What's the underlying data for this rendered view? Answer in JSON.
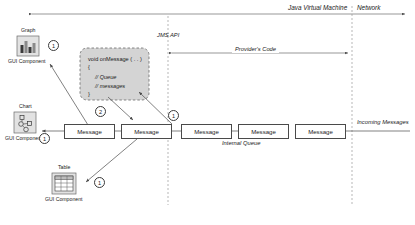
{
  "diagram": {
    "boundaries": {
      "jvm_label": "Java Virtual Machine",
      "network_label": "Network",
      "jms_api_label": "JMS API",
      "providers_code_label": "Provider's Code"
    },
    "gui_components": [
      {
        "id": "graph",
        "title": "Graph",
        "sublabel": "GUI Component",
        "icon": "bar-chart-icon"
      },
      {
        "id": "chart",
        "title": "Chart",
        "sublabel": "GUI Component",
        "icon": "node-graph-icon"
      },
      {
        "id": "table",
        "title": "Table",
        "sublabel": "GUI Component",
        "icon": "grid-table-icon"
      }
    ],
    "code_block": {
      "line1": "void onMessage ( . . )",
      "line2": "{",
      "line3": "// Queue",
      "line4": "// messages",
      "line5": "}"
    },
    "client_messages": [
      {
        "label": "Message"
      },
      {
        "label": "Message"
      }
    ],
    "internal_queue": {
      "caption": "Internal Queue",
      "messages": [
        {
          "label": "Message"
        },
        {
          "label": "Message"
        },
        {
          "label": "Message"
        }
      ]
    },
    "incoming": {
      "label": "Incoming Messages"
    },
    "step_markers": [
      {
        "id": "graph-step",
        "value": "1"
      },
      {
        "id": "chart-step",
        "value": "1"
      },
      {
        "id": "table-step",
        "value": "1"
      },
      {
        "id": "queue-step",
        "value": "1"
      },
      {
        "id": "deliver-step",
        "value": "2"
      }
    ],
    "colors": {
      "fill_gray": "#d4d4d4",
      "icon_gray": "#e2e2e2",
      "stroke": "#4a4a4a",
      "dashed": "#9a9a9a"
    }
  }
}
